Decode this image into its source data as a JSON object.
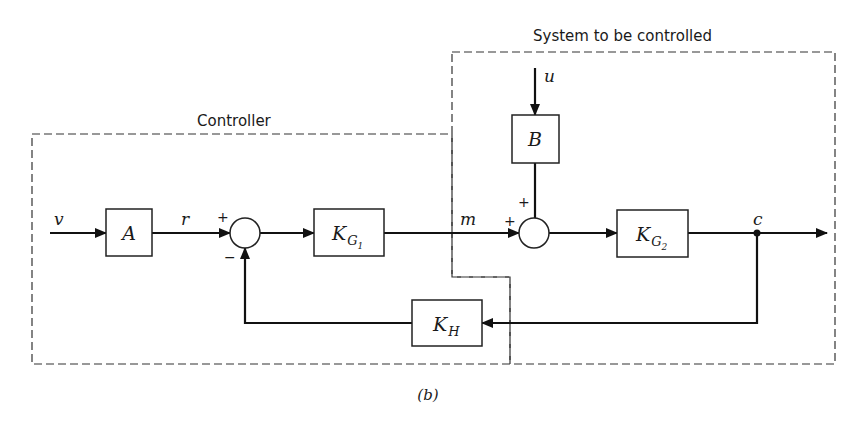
{
  "diagram": {
    "caption": "(b)",
    "regions": {
      "controller": {
        "label": "Controller"
      },
      "plant": {
        "label": "System to be controlled"
      }
    },
    "blocks": {
      "A": {
        "label": "A"
      },
      "KG1": {
        "label": "K",
        "sub": "G",
        "subsub": "1"
      },
      "B": {
        "label": "B"
      },
      "KG2": {
        "label": "K",
        "sub": "G",
        "subsub": "2"
      },
      "KH": {
        "label": "K",
        "sub": "H"
      }
    },
    "signals": {
      "v": "v",
      "r": "r",
      "m": "m",
      "u": "u",
      "c": "c"
    },
    "summing_junctions": {
      "sum1": {
        "plus": "+",
        "minus": "−"
      },
      "sum2": {
        "plus_left": "+",
        "plus_top": "+"
      }
    },
    "colors": {
      "line": "#111111",
      "boundary": "#333333",
      "background": "#ffffff"
    }
  }
}
